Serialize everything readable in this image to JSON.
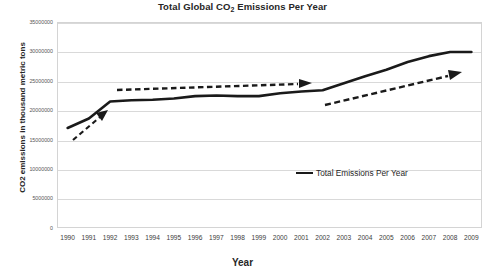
{
  "chart_data": {
    "type": "line",
    "title": "Total Global CO2 Emissions Per Year",
    "title_prefix": "Total Global CO",
    "title_sub": "2",
    "title_suffix": " Emissions Per Year",
    "xlabel": "Year",
    "ylabel": "CO2 emissions in thousand metric tons",
    "categories": [
      1990,
      1991,
      1992,
      1993,
      1994,
      1995,
      1996,
      1997,
      1998,
      1999,
      2000,
      2001,
      2002,
      2003,
      2004,
      2005,
      2006,
      2007,
      2008,
      2009
    ],
    "x": [
      "1990",
      "1991",
      "1992",
      "1993",
      "1994",
      "1995",
      "1996",
      "1997",
      "1998",
      "1999",
      "2000",
      "2001",
      "2002",
      "2003",
      "2004",
      "2005",
      "2006",
      "2007",
      "2008",
      "2009"
    ],
    "series": [
      {
        "name": "Total Emissions Per Year",
        "color": "#1a1a1a",
        "values": [
          17000000,
          18600000,
          21500000,
          21700000,
          21800000,
          22000000,
          22400000,
          22500000,
          22400000,
          22400000,
          22900000,
          23200000,
          23400000,
          24600000,
          25800000,
          26900000,
          28200000,
          29200000,
          29900000,
          29900000
        ]
      }
    ],
    "ylim": [
      0,
      35000000
    ],
    "ytick_values": [
      0,
      5000000,
      10000000,
      15000000,
      20000000,
      25000000,
      30000000,
      35000000
    ],
    "ytick_labels": [
      "0",
      "5000000",
      "10000000",
      "15000000",
      "20000000",
      "25000000",
      "30000000",
      "35000000"
    ],
    "grid": true,
    "legend_position": "inside-lower-right",
    "annotations": [
      {
        "name": "trend-arrow-1",
        "style": "dashed-arrow",
        "note": "rising trend 1990-1992"
      },
      {
        "name": "trend-arrow-2",
        "style": "dashed-arrow",
        "note": "flat/slow trend 1993-2002"
      },
      {
        "name": "trend-arrow-3",
        "style": "dashed-arrow",
        "note": "rising trend 2003-2009"
      }
    ]
  },
  "legend": {
    "entries": [
      {
        "label": "Total Emissions Per Year",
        "color": "#1a1a1a"
      }
    ]
  }
}
